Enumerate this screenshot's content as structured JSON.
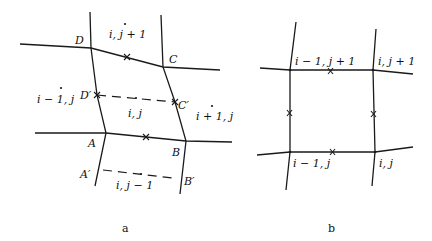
{
  "figure": {
    "panel_a": {
      "caption": "a",
      "vertices": {
        "D": "D",
        "C": "C",
        "A": "A",
        "B": "B",
        "D_prime": "D′",
        "C_prime": "C′",
        "A_prime": "A′",
        "B_prime": "B′"
      },
      "cells": {
        "top": "i, j + 1",
        "center": "i, j",
        "left": "i − 1, j",
        "right": "i + 1, j",
        "bottom": "i, j − 1"
      }
    },
    "panel_b": {
      "caption": "b",
      "nodes": {
        "top_left": "i − 1, j + 1",
        "top_right": "i, j + 1",
        "bottom_left": "i − 1, j",
        "bottom_right": "i, j"
      }
    }
  }
}
